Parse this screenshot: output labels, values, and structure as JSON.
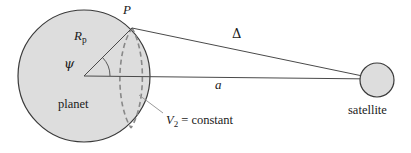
{
  "figure": {
    "background_color": "#ffffff",
    "stroke_color": "#3a3a3a",
    "planet_fill": "#dcdcdc",
    "satellite_fill": "#dcdcdc",
    "dashed_color": "#808080",
    "width": 411,
    "height": 153
  },
  "labels": {
    "point_p": "P",
    "radius_symbol": "R",
    "radius_subscript": "p",
    "angle": "ψ",
    "planet": "planet",
    "equipotential_symbol": "V",
    "equipotential_subscript": "2",
    "equipotential_rest": " = constant",
    "separation_delta": "Δ",
    "semi_major_a": "a",
    "satellite": "satellite"
  },
  "geometry": {
    "planet": {
      "cx": 84,
      "cy": 76,
      "r": 66
    },
    "satellite": {
      "cx": 377,
      "cy": 80,
      "r": 17
    },
    "point_p": {
      "x": 132,
      "y": 28
    },
    "axis_line": {
      "x1": 84,
      "y1": 76,
      "x2": 377,
      "y2": 79
    },
    "delta_line": {
      "x1": 132,
      "y1": 28,
      "x2": 377,
      "y2": 79
    },
    "radius_line": {
      "x1": 84,
      "y1": 76,
      "x2": 132,
      "y2": 28
    },
    "angle_arc_radius": 26,
    "leader_line": {
      "x1": 163,
      "y1": 114,
      "x2": 140,
      "y2": 96
    }
  }
}
